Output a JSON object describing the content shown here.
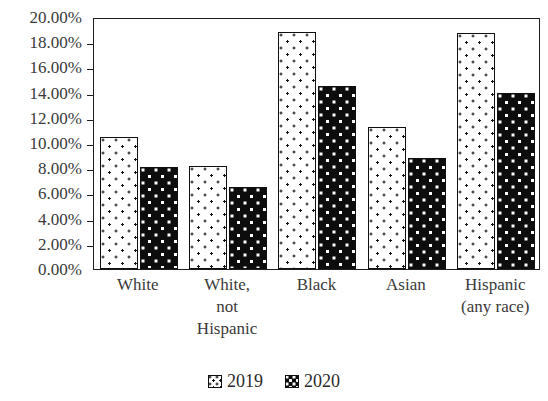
{
  "chart_data": {
    "type": "bar",
    "title": "",
    "subtitle": "",
    "xlabel": "",
    "ylabel": "",
    "ylim": [
      0,
      20
    ],
    "ytick_step": 2,
    "ytick_labels": [
      "20.00%",
      "18.00%",
      "16.00%",
      "14.00%",
      "12.00%",
      "10.00%",
      "8.00%",
      "6.00%",
      "4.00%",
      "2.00%",
      "0.00%"
    ],
    "grid": false,
    "legend_position": "bottom",
    "categories": [
      "White",
      "White,\nnot\nHispanic",
      "Black",
      "Asian",
      "Hispanic\n(any race)"
    ],
    "series": [
      {
        "name": "2019",
        "values": [
          10.5,
          8.2,
          18.8,
          11.3,
          18.7
        ],
        "swatch": "light-dotted",
        "color": "#ffffff"
      },
      {
        "name": "2020",
        "values": [
          8.1,
          6.5,
          14.5,
          8.8,
          14.0
        ],
        "swatch": "dark-dotted",
        "color": "#0d0d0d"
      }
    ]
  },
  "legend": {
    "items": [
      {
        "label": "2019"
      },
      {
        "label": "2020"
      }
    ]
  },
  "colors": {
    "axis": "#1d1d1d",
    "text": "#2b2b2b",
    "tick_text": "#3a3a3a",
    "series_2019_fill": "#ffffff",
    "series_2019_dots": "#121212",
    "series_2020_fill": "#0d0d0d",
    "series_2020_dots": "#ffffff",
    "background": "#ffffff"
  }
}
